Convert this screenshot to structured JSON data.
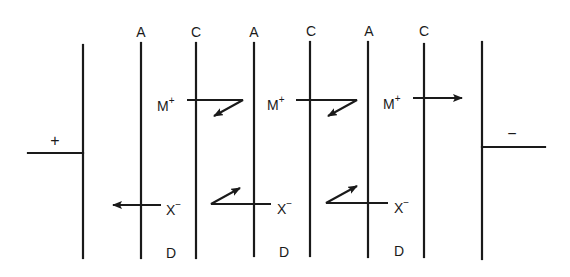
{
  "diagram": {
    "type": "electrodialysis-stack",
    "colors": {
      "ink": "#1a1a1a",
      "background": "#ffffff"
    },
    "electrodes": {
      "anode": {
        "sign": "+",
        "side": "left"
      },
      "cathode": {
        "sign": "−",
        "side": "right"
      }
    },
    "membranes": [
      {
        "type": "A",
        "label": "A"
      },
      {
        "type": "C",
        "label": "C"
      },
      {
        "type": "A",
        "label": "A"
      },
      {
        "type": "C",
        "label": "C"
      },
      {
        "type": "A",
        "label": "A"
      },
      {
        "type": "C",
        "label": "C"
      }
    ],
    "compartments": [
      {
        "label": "D",
        "kind": "diluate"
      },
      {
        "label": "D",
        "kind": "diluate"
      },
      {
        "label": "D",
        "kind": "diluate"
      }
    ],
    "ions": {
      "cation": {
        "base": "M",
        "charge": "+"
      },
      "anion": {
        "base": "X",
        "charge": "−"
      }
    },
    "cation_labels": [
      {
        "base": "M",
        "charge": "+"
      },
      {
        "base": "M",
        "charge": "+"
      },
      {
        "base": "M",
        "charge": "+"
      }
    ],
    "anion_labels": [
      {
        "base": "X",
        "charge": "−"
      },
      {
        "base": "X",
        "charge": "−"
      },
      {
        "base": "X",
        "charge": "−"
      }
    ]
  }
}
